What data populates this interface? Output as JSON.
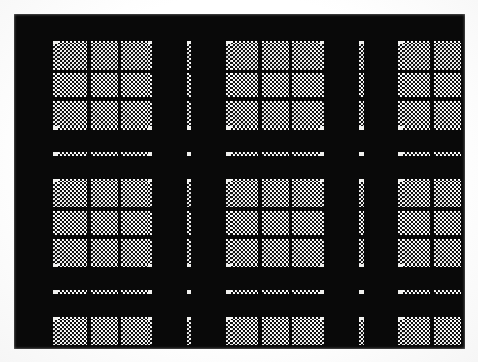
{
  "image": {
    "kind": "tartan-swatch",
    "title": "Black and white tartan plaid pattern",
    "description": "Symmetric woven check (sett) rendered in black, white and a 50% dithered grey halftone",
    "width": 478,
    "height": 362
  },
  "palette": {
    "black": "#090909",
    "white": "#f2f2f0",
    "grey_dither_dark": "#111111",
    "grey_dither_light": "#ffffff",
    "background": "#fdfdfd"
  },
  "swatch": {
    "left": 14,
    "top": 14,
    "width": 451,
    "height": 335
  },
  "legend": {
    "black_label": "black",
    "grey_label": "grey (50% dither)",
    "white_label": "white"
  },
  "weave": {
    "note": "Darker of warp/weft wins at each crossing; white x white = white; grey x white = grey; black x anything = black",
    "rule_order": [
      "K",
      "G",
      "W"
    ]
  },
  "warp": {
    "label": "vertical stripe sequence (x, width, colour)",
    "stripes": [
      {
        "x": 0,
        "w": 43,
        "c": "K"
      },
      {
        "x": 43,
        "w": 5,
        "c": "W"
      },
      {
        "x": 48,
        "w": 32,
        "c": "G"
      },
      {
        "x": 80,
        "w": 4,
        "c": "K"
      },
      {
        "x": 84,
        "w": 29,
        "c": "G"
      },
      {
        "x": 113,
        "w": 4,
        "c": "K"
      },
      {
        "x": 117,
        "w": 29,
        "c": "G"
      },
      {
        "x": 146,
        "w": 4,
        "c": "W"
      },
      {
        "x": 150,
        "w": 38,
        "c": "K"
      },
      {
        "x": 188,
        "w": 5,
        "c": "W"
      },
      {
        "x": 193,
        "w": 38,
        "c": "K"
      },
      {
        "x": 231,
        "w": 5,
        "c": "W"
      },
      {
        "x": 236,
        "w": 30,
        "c": "G"
      },
      {
        "x": 266,
        "w": 4,
        "c": "K"
      },
      {
        "x": 270,
        "w": 29,
        "c": "G"
      },
      {
        "x": 299,
        "w": 4,
        "c": "K"
      },
      {
        "x": 303,
        "w": 30,
        "c": "G"
      },
      {
        "x": 333,
        "w": 5,
        "c": "W"
      },
      {
        "x": 338,
        "w": 38,
        "c": "K"
      },
      {
        "x": 376,
        "w": 5,
        "c": "W"
      },
      {
        "x": 381,
        "w": 37,
        "c": "K"
      },
      {
        "x": 418,
        "w": 5,
        "c": "W"
      },
      {
        "x": 423,
        "w": 30,
        "c": "G"
      },
      {
        "x": 453,
        "w": 4,
        "c": "K"
      },
      {
        "x": 457,
        "w": 30,
        "c": "G"
      },
      {
        "x": 487,
        "w": 4,
        "c": "K"
      }
    ]
  },
  "weft": {
    "label": "horizontal stripe sequence (y, height, colour)",
    "stripes": [
      {
        "y": 0,
        "h": 30,
        "c": "K"
      },
      {
        "y": 30,
        "h": 4,
        "c": "W"
      },
      {
        "y": 34,
        "h": 28,
        "c": "G"
      },
      {
        "y": 62,
        "h": 4,
        "c": "K"
      },
      {
        "y": 66,
        "h": 27,
        "c": "G"
      },
      {
        "y": 93,
        "h": 4,
        "c": "K"
      },
      {
        "y": 97,
        "h": 28,
        "c": "G"
      },
      {
        "y": 125,
        "h": 4,
        "c": "W"
      },
      {
        "y": 129,
        "h": 25,
        "c": "K"
      },
      {
        "y": 154,
        "h": 5,
        "c": "W"
      },
      {
        "y": 159,
        "h": 25,
        "c": "K"
      },
      {
        "y": 184,
        "h": 4,
        "c": "W"
      },
      {
        "y": 188,
        "h": 28,
        "c": "G"
      },
      {
        "y": 216,
        "h": 4,
        "c": "K"
      },
      {
        "y": 220,
        "h": 27,
        "c": "G"
      },
      {
        "y": 247,
        "h": 4,
        "c": "K"
      },
      {
        "y": 251,
        "h": 28,
        "c": "G"
      },
      {
        "y": 279,
        "h": 4,
        "c": "W"
      },
      {
        "y": 283,
        "h": 25,
        "c": "K"
      },
      {
        "y": 308,
        "h": 5,
        "c": "W"
      },
      {
        "y": 313,
        "h": 25,
        "c": "K"
      },
      {
        "y": 338,
        "h": 4,
        "c": "W"
      },
      {
        "y": 342,
        "h": 28,
        "c": "G"
      },
      {
        "y": 370,
        "h": 4,
        "c": "K"
      }
    ]
  }
}
